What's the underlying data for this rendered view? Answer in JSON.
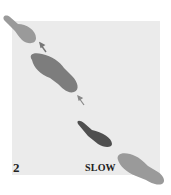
{
  "figure": {
    "panel_number": "2",
    "speed_label": "SLOW",
    "colors": {
      "background": "#ebebeb",
      "footprint_light": "#9a9a9a",
      "footprint_mid": "#7d7d7d",
      "footprint_dark": "#4f4f4f",
      "arrow": "#777777"
    },
    "footprints": [
      {
        "id": 1,
        "shade": "light",
        "direction": "up-left"
      },
      {
        "id": 2,
        "shade": "mid",
        "direction": "up-left"
      },
      {
        "id": 3,
        "shade": "dark",
        "direction": "up-left"
      },
      {
        "id": 4,
        "shade": "light",
        "direction": "up-left"
      }
    ],
    "arrows": [
      {
        "id": 1,
        "direction": "up-left"
      },
      {
        "id": 2,
        "direction": "up-left"
      }
    ]
  }
}
